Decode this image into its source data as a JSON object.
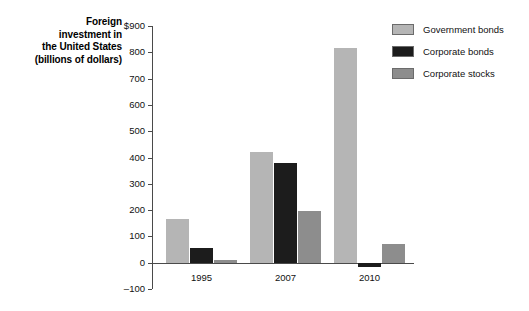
{
  "chart_data": {
    "type": "bar",
    "title": "Foreign investment in the United States (billions of dollars)",
    "title_lines": [
      "Foreign",
      "investment in",
      "the United States",
      "(billions of dollars)"
    ],
    "xlabel": "",
    "ylabel": "",
    "categories": [
      "1995",
      "2007",
      "2010"
    ],
    "series": [
      {
        "name": "Government bonds",
        "color": "#b5b5b5",
        "values": [
          165,
          420,
          815
        ]
      },
      {
        "name": "Corporate bonds",
        "color": "#1c1c1c",
        "values": [
          57,
          378,
          -15
        ]
      },
      {
        "name": "Corporate stocks",
        "color": "#8d8d8d",
        "values": [
          10,
          196,
          70
        ]
      }
    ],
    "ylim": [
      -100,
      900
    ],
    "ytick_values": [
      900,
      800,
      700,
      600,
      500,
      400,
      300,
      200,
      100,
      0,
      -100
    ],
    "ytick_labels": [
      "$900",
      "800",
      "700",
      "600",
      "500",
      "400",
      "300",
      "200",
      "100",
      "0",
      "–100"
    ],
    "grid": false,
    "legend_position": "right",
    "legend": [
      "Government bonds",
      "Corporate bonds",
      "Corporate stocks"
    ]
  }
}
